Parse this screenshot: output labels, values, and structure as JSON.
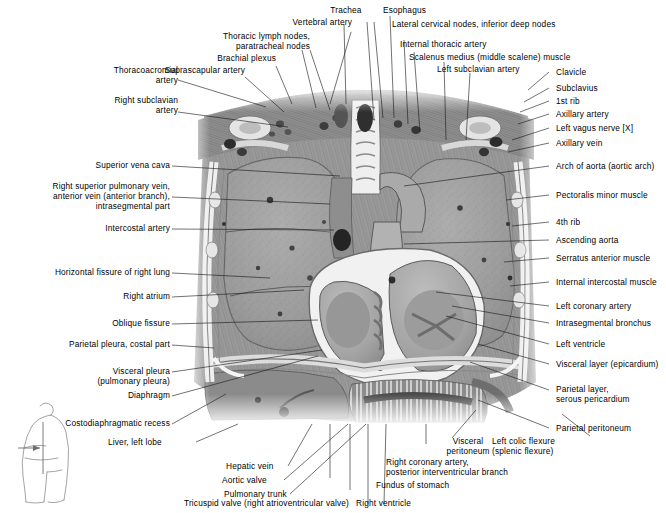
{
  "figure": {
    "type": "anatomical-atlas-plate",
    "region": "thorax",
    "plane": "coronal section",
    "palette": {
      "ink": "#1a1a1a",
      "paper": "#ffffff",
      "lung": "#9a9a9a",
      "muscle": "#8a8a8a",
      "bone": "#e8e8e8",
      "vessel_dark": "#2e2e2e",
      "heart": "#a5a5a5",
      "pericardium": "#f2f2f2"
    }
  },
  "orientation_diagram": {
    "name": "body-silhouette-section-indicator",
    "description": "Small line drawing of a torso in lateral view with an arrow and line marking the coronal section level"
  },
  "labels_top": [
    {
      "id": "thoracoacromial-artery",
      "text": "Thoracoacromial\nartery"
    },
    {
      "id": "suprascapular-artery",
      "text": "Suprascapular artery"
    },
    {
      "id": "brachial-plexus",
      "text": "Brachial plexus"
    },
    {
      "id": "thoracic-lymph-nodes",
      "text": "Thoracic lymph nodes,\nparatracheal nodes"
    },
    {
      "id": "vertebral-artery",
      "text": "Vertebral artery"
    },
    {
      "id": "trachea",
      "text": "Trachea"
    },
    {
      "id": "esophagus",
      "text": "Esophagus"
    },
    {
      "id": "lateral-cervical-nodes",
      "text": "Lateral cervical nodes, inferior deep nodes"
    },
    {
      "id": "internal-thoracic-artery",
      "text": "Internal thoracic artery"
    },
    {
      "id": "scalenus-medius",
      "text": "Scalenus medius (middle scalene) muscle"
    },
    {
      "id": "left-subclavian-artery",
      "text": "Left subclavian artery"
    },
    {
      "id": "right-subclavian-artery",
      "text": "Right subclavian\nartery"
    }
  ],
  "labels_left": [
    {
      "id": "superior-vena-cava",
      "text": "Superior vena cava"
    },
    {
      "id": "right-superior-pulmonary-vein",
      "text": "Right superior pulmonary vein,\nanterior vein (anterior branch),\nintrasegmental part"
    },
    {
      "id": "intercostal-artery",
      "text": "Intercostal artery"
    },
    {
      "id": "horizontal-fissure",
      "text": "Horizontal fissure of right lung"
    },
    {
      "id": "right-atrium",
      "text": "Right atrium"
    },
    {
      "id": "oblique-fissure",
      "text": "Oblique fissure"
    },
    {
      "id": "parietal-pleura-costal-part",
      "text": "Parietal pleura, costal part"
    },
    {
      "id": "visceral-pleura",
      "text": "Visceral pleura\n(pulmonary pleura)"
    },
    {
      "id": "diaphragm",
      "text": "Diaphragm"
    },
    {
      "id": "costodiaphragmatic-recess",
      "text": "Costodiaphragmatic recess"
    }
  ],
  "labels_right": [
    {
      "id": "clavicle",
      "text": "Clavicle"
    },
    {
      "id": "subclavius",
      "text": "Subclavius"
    },
    {
      "id": "first-rib",
      "text": "1st rib"
    },
    {
      "id": "axillary-artery",
      "text": "Axillary artery"
    },
    {
      "id": "left-vagus-nerve",
      "text": "Left vagus nerve [X]"
    },
    {
      "id": "axillary-vein",
      "text": "Axillary vein"
    },
    {
      "id": "arch-of-aorta",
      "text": "Arch of aorta (aortic arch)"
    },
    {
      "id": "pectoralis-minor-muscle",
      "text": "Pectoralis minor muscle"
    },
    {
      "id": "fourth-rib",
      "text": "4th rib"
    },
    {
      "id": "ascending-aorta",
      "text": "Ascending aorta"
    },
    {
      "id": "serratus-anterior-muscle",
      "text": "Serratus anterior muscle"
    },
    {
      "id": "internal-intercostal-muscle",
      "text": "Internal intercostal muscle"
    },
    {
      "id": "left-coronary-artery",
      "text": "Left coronary artery"
    },
    {
      "id": "intrasegmental-bronchus",
      "text": "Intrasegmental bronchus"
    },
    {
      "id": "left-ventricle",
      "text": "Left ventricle"
    },
    {
      "id": "visceral-layer-epicardium",
      "text": "Visceral layer (epicardium)"
    },
    {
      "id": "parietal-layer-serous-pericardium",
      "text": "Parietal layer,\nserous pericardium"
    },
    {
      "id": "parietal-peritoneum",
      "text": "Parietal peritoneum"
    }
  ],
  "labels_bottom": [
    {
      "id": "liver-left-lobe",
      "text": "Liver, left lobe"
    },
    {
      "id": "hepatic-vein",
      "text": "Hepatic vein"
    },
    {
      "id": "aortic-valve",
      "text": "Aortic valve"
    },
    {
      "id": "pulmonary-trunk",
      "text": "Pulmonary trunk"
    },
    {
      "id": "tricuspid-valve",
      "text": "Tricuspid valve (right atrioventricular valve)"
    },
    {
      "id": "right-ventricle",
      "text": "Right ventricle"
    },
    {
      "id": "fundus-of-stomach",
      "text": "Fundus of stomach"
    },
    {
      "id": "right-coronary-artery",
      "text": "Right coronary artery,\nposterior interventricular branch"
    },
    {
      "id": "visceral-peritoneum",
      "text": "Visceral\nperitoneum"
    },
    {
      "id": "left-colic-flexure",
      "text": "Left colic flexure\n(splenic flexure)"
    }
  ]
}
